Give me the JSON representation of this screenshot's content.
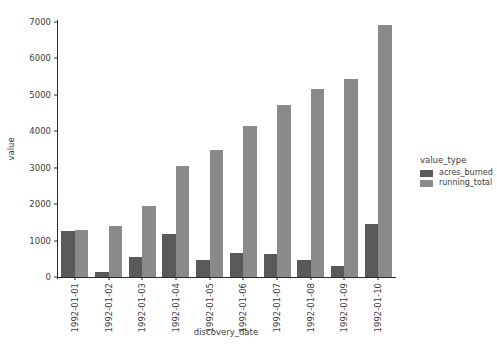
{
  "chart_data": {
    "type": "bar",
    "title": "",
    "xlabel": "discovery_date",
    "ylabel": "value",
    "categories": [
      "1992-01-01",
      "1992-01-02",
      "1992-01-03",
      "1992-01-04",
      "1992-01-05",
      "1992-01-06",
      "1992-01-07",
      "1992-01-08",
      "1992-01-09",
      "1992-01-10"
    ],
    "series": [
      {
        "name": "acres_burned",
        "color": "#595959",
        "values": [
          1260,
          130,
          560,
          1170,
          460,
          670,
          620,
          470,
          300,
          1450
        ]
      },
      {
        "name": "running_total",
        "color": "#8a8a8a",
        "values": [
          1280,
          1390,
          1950,
          3060,
          3500,
          4150,
          4720,
          5170,
          5440,
          6920
        ]
      }
    ],
    "ylim": [
      0,
      7000
    ],
    "yticks": [
      0,
      1000,
      2000,
      3000,
      4000,
      5000,
      6000,
      7000
    ],
    "ytick_labels": [
      "0",
      "1000",
      "2000",
      "3000",
      "4000",
      "5000",
      "6000",
      "7000"
    ],
    "grid": false,
    "legend_position": "right-outside"
  },
  "legend": {
    "title": "value_type",
    "entries": [
      {
        "label": "acres_burned",
        "color": "#595959"
      },
      {
        "label": "running_total",
        "color": "#8a8a8a"
      }
    ]
  }
}
